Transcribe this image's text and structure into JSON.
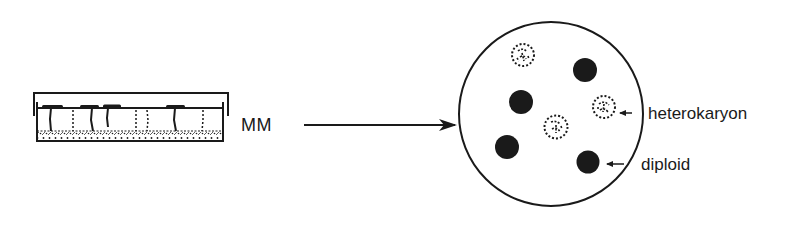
{
  "diagram": {
    "type": "replica-plating-schematic",
    "source_plate": {
      "label": "MM",
      "description": "petri dish side view with lid, agar medium and toothpick inoculations",
      "stab_lines": [
        {
          "x": 51,
          "style": "solid",
          "tab": true
        },
        {
          "x": 73,
          "style": "dotted",
          "tab": false
        },
        {
          "x": 92,
          "style": "solid",
          "tab": true
        },
        {
          "x": 108,
          "style": "solid",
          "tab": true
        },
        {
          "x": 136,
          "style": "dotted",
          "tab": false
        },
        {
          "x": 147,
          "style": "dotted",
          "tab": false
        },
        {
          "x": 175,
          "style": "solid",
          "tab": true
        },
        {
          "x": 203,
          "style": "dotted",
          "tab": false
        }
      ]
    },
    "arrow": {
      "from": "source_plate",
      "to": "result_plate"
    },
    "result_plate": {
      "description": "petri dish top view with colonies",
      "center": [
        551,
        114
      ],
      "radius": 92,
      "colonies": [
        {
          "type": "heterokaryon",
          "x": 523,
          "y": 55
        },
        {
          "type": "diploid",
          "x": 585,
          "y": 70
        },
        {
          "type": "diploid",
          "x": 521,
          "y": 102
        },
        {
          "type": "heterokaryon",
          "x": 604,
          "y": 107
        },
        {
          "type": "heterokaryon",
          "x": 556,
          "y": 127
        },
        {
          "type": "diploid",
          "x": 507,
          "y": 147
        },
        {
          "type": "diploid",
          "x": 588,
          "y": 162
        }
      ]
    },
    "labels": {
      "heterokaryon": "heterokaryon",
      "diploid": "diploid"
    },
    "colors": {
      "ink": "#1a1a1a",
      "background": "#ffffff"
    }
  }
}
